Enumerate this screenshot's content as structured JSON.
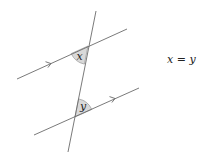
{
  "diagram": {
    "transversal": {
      "x1": 96,
      "y1": 11,
      "x2": 68,
      "y2": 152
    },
    "parallel_lines": [
      {
        "name": "upper",
        "x1": 17,
        "y1": 79,
        "x2": 127,
        "y2": 29,
        "arrow_at": [
          50,
          64
        ]
      },
      {
        "name": "lower",
        "x1": 34,
        "y1": 135,
        "x2": 139,
        "y2": 88,
        "arrow_at": [
          114,
          99
        ]
      }
    ],
    "angles": [
      {
        "label": "x",
        "vertex": [
          88,
          46
        ]
      },
      {
        "label": "y",
        "vertex": [
          75,
          117
        ]
      }
    ],
    "colors": {
      "line": "#6b6b6b",
      "angle_fill": "#d9d9d9",
      "text": "#222222"
    }
  },
  "equation": {
    "left": "x",
    "operator": "=",
    "right": "y"
  }
}
